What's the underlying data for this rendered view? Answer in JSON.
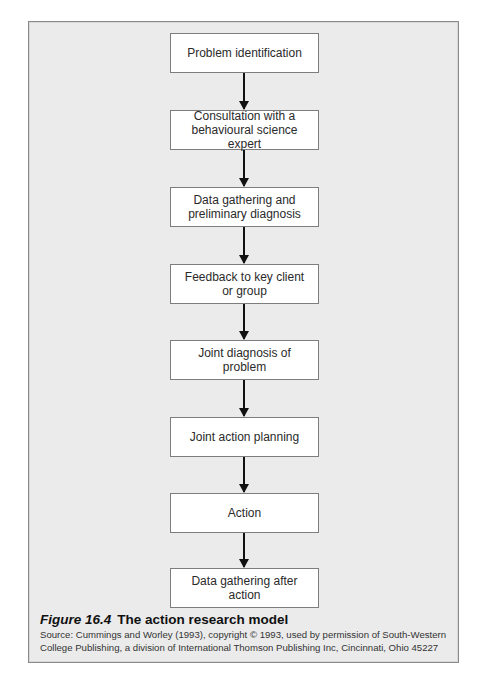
{
  "page_header": "",
  "diagram": {
    "steps": [
      {
        "label": "Problem identification"
      },
      {
        "label": "Consultation with a\nbehavioural science expert"
      },
      {
        "label": "Data gathering and\npreliminary diagnosis"
      },
      {
        "label": "Feedback to key client\nor group"
      },
      {
        "label": "Joint diagnosis of problem"
      },
      {
        "label": "Joint action planning"
      },
      {
        "label": "Action"
      },
      {
        "label": "Data gathering after action"
      }
    ],
    "colors": {
      "panel_background": "#ebebeb",
      "box_background": "#ffffff",
      "box_border": "#7d7d7d",
      "arrow": "#111111"
    }
  },
  "caption": {
    "figure_number": "Figure 16.4",
    "title": "The action research model",
    "source": "Source: Cummings and Worley (1993), copyright © 1993, used by permission of South-Western\nCollege Publishing, a division of International Thomson Publishing Inc, Cincinnati, Ohio 45227"
  }
}
